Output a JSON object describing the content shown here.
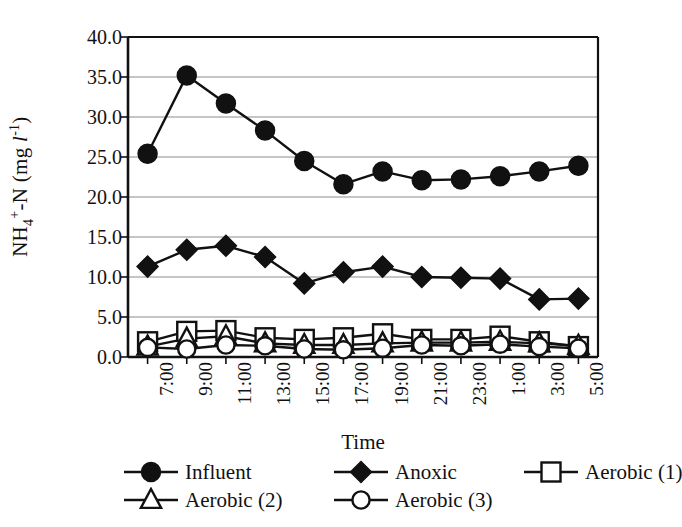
{
  "chart_data": {
    "type": "line",
    "title": "",
    "xlabel": "Time",
    "ylabel": "NH4+-N (mg l-1)",
    "ylabel_parts": {
      "base": "NH",
      "sub": "4",
      "sup": "+",
      "tail": "-N (mg ",
      "unit_italic": "l",
      "unit_sup": "-1",
      "close": ")"
    },
    "categories": [
      "7:00",
      "9:00",
      "11:00",
      "13:00",
      "15:00",
      "17:00",
      "19:00",
      "21:00",
      "23:00",
      "1:00",
      "3:00",
      "5:00"
    ],
    "ylim": [
      0,
      40
    ],
    "ytick_values": [
      "0.0",
      "5.0",
      "10.0",
      "15.0",
      "20.0",
      "25.0",
      "30.0",
      "35.0",
      "40.0"
    ],
    "grid": true,
    "legend_position": "below",
    "series": [
      {
        "name": "Influent",
        "marker": "filled-circle",
        "color": "#111111",
        "values": [
          25.4,
          35.2,
          31.7,
          28.3,
          24.5,
          21.6,
          23.2,
          22.1,
          22.2,
          22.6,
          23.2,
          23.9
        ]
      },
      {
        "name": "Anoxic",
        "marker": "filled-diamond",
        "color": "#111111",
        "values": [
          11.3,
          13.4,
          13.9,
          12.5,
          9.2,
          10.6,
          11.3,
          10.0,
          9.9,
          9.8,
          7.2,
          7.3
        ]
      },
      {
        "name": "Aerobic (1)",
        "marker": "open-square",
        "color": "#111111",
        "values": [
          1.9,
          3.2,
          3.3,
          2.4,
          2.2,
          2.4,
          2.9,
          2.2,
          2.2,
          2.6,
          1.9,
          1.3
        ]
      },
      {
        "name": "Aerobic (2)",
        "marker": "open-triangle",
        "color": "#111111",
        "values": [
          1.3,
          2.3,
          2.6,
          1.7,
          1.5,
          1.5,
          1.7,
          1.8,
          1.8,
          1.9,
          1.7,
          1.4
        ]
      },
      {
        "name": "Aerobic (3)",
        "marker": "open-circle",
        "color": "#111111",
        "values": [
          1.2,
          1.0,
          1.5,
          1.4,
          1.0,
          0.9,
          1.1,
          1.5,
          1.4,
          1.6,
          1.3,
          1.1
        ]
      }
    ]
  },
  "legend": {
    "rows": [
      [
        {
          "label": "Influent",
          "marker": "filled-circle"
        },
        {
          "label": "Anoxic",
          "marker": "filled-diamond"
        },
        {
          "label": "Aerobic (1)",
          "marker": "open-square"
        }
      ],
      [
        {
          "label": "Aerobic (2)",
          "marker": "open-triangle"
        },
        {
          "label": "Aerobic (3)",
          "marker": "open-circle"
        }
      ]
    ]
  },
  "style": {
    "ink": "#111111",
    "grid": "#8c8c8c",
    "background": "#ffffff"
  }
}
